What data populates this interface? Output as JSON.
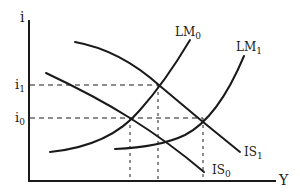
{
  "diagram": {
    "type": "IS-LM",
    "axes": {
      "y_label": "i",
      "x_label": "Y"
    },
    "interest_levels": [
      {
        "label_main": "i",
        "label_sub": "1",
        "y": 85
      },
      {
        "label_main": "i",
        "label_sub": "0",
        "y": 118
      }
    ],
    "curves": [
      {
        "id": "LM0",
        "label_main": "LM",
        "label_sub": "0"
      },
      {
        "id": "LM1",
        "label_main": "LM",
        "label_sub": "1"
      },
      {
        "id": "IS1",
        "label_main": "IS",
        "label_sub": "1"
      },
      {
        "id": "IS0",
        "label_main": "IS",
        "label_sub": "0"
      }
    ],
    "equilibria": [
      {
        "curves": [
          "IS0",
          "LM0"
        ],
        "rate": "i0",
        "x": 130
      },
      {
        "curves": [
          "IS1",
          "LM0"
        ],
        "rate": "i1",
        "x": 158
      },
      {
        "curves": [
          "IS1",
          "LM1"
        ],
        "rate": "i0",
        "x": 203
      }
    ],
    "colors": {
      "ink": "#1a1a1a",
      "background": "#ffffff"
    }
  }
}
